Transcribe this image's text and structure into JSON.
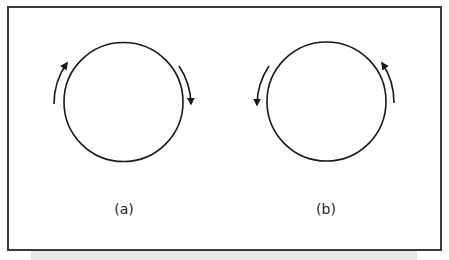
{
  "figure": {
    "panels": [
      {
        "id": "a",
        "label": "(a)",
        "circle": {
          "cx": 123.5,
          "cy": 102,
          "r": 59.5
        },
        "rotation": "clockwise",
        "arrows": [
          {
            "name": "left-arrow-up",
            "direction": "up"
          },
          {
            "name": "right-arrow-down",
            "direction": "down"
          }
        ]
      },
      {
        "id": "b",
        "label": "(b)",
        "circle": {
          "cx": 326.5,
          "cy": 101.5,
          "r": 59.5
        },
        "rotation": "counterclockwise",
        "arrows": [
          {
            "name": "left-arrow-down",
            "direction": "down"
          },
          {
            "name": "right-arrow-up",
            "direction": "up"
          }
        ]
      }
    ],
    "colors": {
      "stroke": "#1a1a1a",
      "frame": "#3a3a3a",
      "strip": "#e9e9e9"
    }
  }
}
